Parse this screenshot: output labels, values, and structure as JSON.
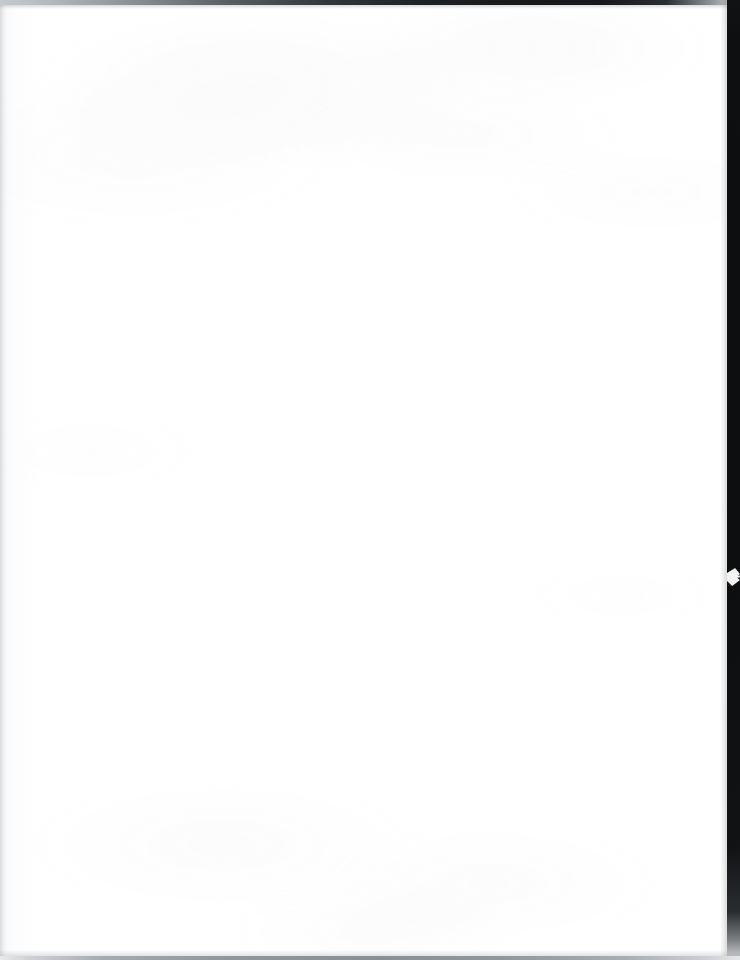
{
  "document": {
    "kind": "scanned-page",
    "page_content": "",
    "content_description": "blank page",
    "width_px": 740,
    "height_px": 960
  },
  "appearance": {
    "paper_color": "#ffffff",
    "paper_tint_left": "#f2f3f4",
    "scan_backdrop_color": "#0c0e10",
    "top_edge_light": "#c6cacd",
    "top_edge_dark": "#15171a",
    "bottom_shadow_color": "#8b8e92",
    "left_margin_shade": "#c4c7cb"
  },
  "artifacts": {
    "top_edge": {
      "name": "top-scan-edge",
      "height_px": 5,
      "description": "dark horizontal scanner edge strip, lighter at left, near-black toward right"
    },
    "right_edge": {
      "name": "right-scan-edge",
      "width_px": 13,
      "description": "near-black vertical scanner backdrop along right edge, fading near bottom"
    },
    "right_notch": {
      "name": "page-edge-notch",
      "top_px": 568,
      "height_px": 18,
      "description": "small light torn notch intruding into the right dark band"
    },
    "bottom_edge": {
      "name": "bottom-scan-edge",
      "height_px": 4,
      "description": "faint gray shadow line along the bottom of the page"
    },
    "left_edge": {
      "name": "left-margin-shade",
      "width_px": 9,
      "description": "subtle gray gradient along the left margin"
    }
  }
}
